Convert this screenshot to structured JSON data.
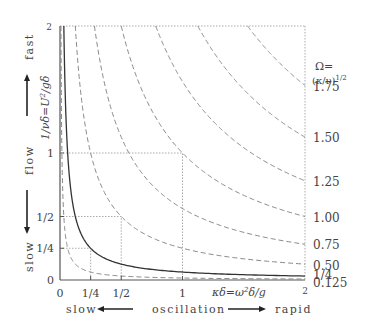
{
  "chart_data": {
    "type": "line",
    "title": "",
    "xlabel": "κδ = ω²δ/g",
    "ylabel": "1/νδ = U²/gδ",
    "xlim": [
      0,
      2
    ],
    "ylim": [
      0,
      2
    ],
    "x_ticks": [
      {
        "value": 0,
        "label": "0"
      },
      {
        "value": 0.25,
        "label": "1/4"
      },
      {
        "value": 0.5,
        "label": "1/2"
      },
      {
        "value": 1,
        "label": "1"
      },
      {
        "value": 2,
        "label": "2"
      }
    ],
    "y_ticks": [
      {
        "value": 0,
        "label": "0"
      },
      {
        "value": 0.25,
        "label": "1/4"
      },
      {
        "value": 0.5,
        "label": "1/2"
      },
      {
        "value": 1,
        "label": "1"
      },
      {
        "value": 2,
        "label": "2"
      }
    ],
    "grid": false,
    "curve_family": "xy = Ω²",
    "parameter_label_line1": "Ω=",
    "parameter_label_line2": "(κ/ν)^1/2",
    "series": [
      {
        "name": "0.125",
        "omega": 0.125,
        "style": "dashed"
      },
      {
        "name": "1/4",
        "omega": 0.25,
        "style": "solid"
      },
      {
        "name": "0.50",
        "omega": 0.5,
        "style": "dashed"
      },
      {
        "name": "0.75",
        "omega": 0.75,
        "style": "dashed"
      },
      {
        "name": "1.00",
        "omega": 1.0,
        "style": "dashed"
      },
      {
        "name": "1.25",
        "omega": 1.25,
        "style": "dashed"
      },
      {
        "name": "1.50",
        "omega": 1.5,
        "style": "dashed"
      },
      {
        "name": "1.75",
        "omega": 1.75,
        "style": "dashed"
      }
    ],
    "guide_boxes": [
      {
        "x": 0.25,
        "y": 0.25
      },
      {
        "x": 0.5,
        "y": 0.5
      },
      {
        "x": 1,
        "y": 1
      }
    ],
    "annotations": {
      "x_left": "slow",
      "x_middle": "oscillation",
      "x_right": "rapid",
      "y_top": "fast",
      "y_middle": "flow",
      "y_bottom": "slow"
    }
  },
  "colors": {
    "axis": "#555555",
    "solid_curve": "#333333",
    "dashed_curve": "#888888",
    "guide": "#aaaaaa",
    "text": "#444444"
  }
}
